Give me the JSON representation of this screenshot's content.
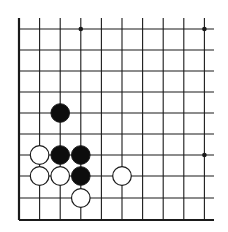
{
  "board": {
    "description": "Go board corner section (lower-left corner)",
    "columns_x": [
      19,
      39.6,
      60.2,
      80.8,
      101.4,
      122,
      142.6,
      163.2,
      183.8,
      204.4
    ],
    "rows_y": [
      29,
      50,
      71,
      92,
      113,
      134,
      155,
      176,
      198,
      220
    ],
    "line_top": 18,
    "line_right": 214,
    "edge_left": true,
    "edge_bottom": true,
    "line_color": "#1a1a1a",
    "stone_radius": 9.3,
    "star_points": [
      {
        "col": 3,
        "row": 0
      },
      {
        "col": 9,
        "row": 0
      },
      {
        "col": 9,
        "row": 6
      }
    ],
    "stones": [
      {
        "color": "black",
        "col": 2,
        "row": 4
      },
      {
        "color": "white",
        "col": 1,
        "row": 6
      },
      {
        "color": "black",
        "col": 2,
        "row": 6
      },
      {
        "color": "black",
        "col": 3,
        "row": 6
      },
      {
        "color": "white",
        "col": 1,
        "row": 7
      },
      {
        "color": "white",
        "col": 2,
        "row": 7
      },
      {
        "color": "black",
        "col": 3,
        "row": 7
      },
      {
        "color": "white",
        "col": 5,
        "row": 7
      },
      {
        "color": "white",
        "col": 3,
        "row": 8
      }
    ]
  }
}
